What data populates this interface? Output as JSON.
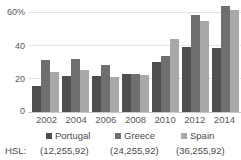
{
  "chart_data": {
    "type": "bar",
    "title": "",
    "xlabel": "",
    "ylabel": "",
    "categories": [
      "2002",
      "2004",
      "2006",
      "2008",
      "2010",
      "2012",
      "2014"
    ],
    "series": [
      {
        "name": "Portugal",
        "color": "#4f4f4f",
        "hsl": "(12,255,92)",
        "values": [
          14,
          19.5,
          19.5,
          20.5,
          27,
          35,
          34.5
        ]
      },
      {
        "name": "Greece",
        "color": "#6f6f6f",
        "hsl": "(24,255,92)",
        "values": [
          28,
          28.5,
          25,
          20.5,
          30,
          52,
          57
        ]
      },
      {
        "name": "Spain",
        "color": "#a8a8a8",
        "hsl": "(36,255,92)",
        "values": [
          21.5,
          22.5,
          18.5,
          20,
          39,
          49,
          54.5
        ]
      }
    ],
    "ylim": [
      0,
      60
    ],
    "yticks": [
      0,
      20,
      40,
      60
    ],
    "ytick_labels": [
      "0",
      "20",
      "40",
      "60%"
    ],
    "grid": true,
    "legend_position": "bottom"
  },
  "hsl": {
    "label": "HSL:",
    "values": [
      "(12,255,92)",
      "(24,255,92)",
      "(36,255,92)"
    ]
  }
}
